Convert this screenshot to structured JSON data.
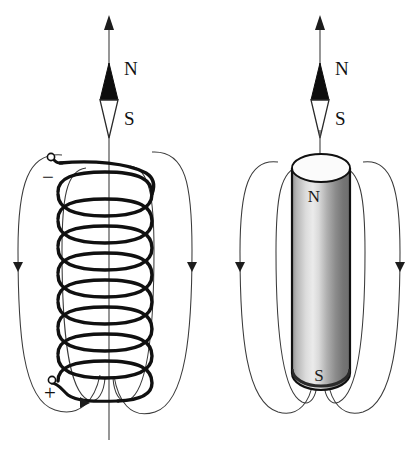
{
  "figure": {
    "background_color": "#ffffff",
    "width": 420,
    "height": 475
  },
  "panels": [
    {
      "id": "solenoid-panel",
      "name": "solenoid",
      "compass": {
        "north_label": "N",
        "south_label": "S",
        "north_color": "#0d0d0d",
        "south_color": "#ffffff"
      },
      "terminals": [
        {
          "name": "negative-terminal",
          "sign": "−",
          "position": "top-left"
        },
        {
          "name": "positive-terminal",
          "sign": "+",
          "position": "bottom-left"
        }
      ],
      "coil": {
        "turns": 8,
        "wire_color": "#101010"
      },
      "field_lines": {
        "count": 4,
        "arrow_direction": "down",
        "color": "#3a3a3a"
      }
    },
    {
      "id": "bar-magnet-panel",
      "name": "bar-magnet",
      "compass": {
        "north_label": "N",
        "south_label": "S",
        "north_color": "#0d0d0d",
        "south_color": "#ffffff"
      },
      "magnet": {
        "north_label": "N",
        "south_label": "S",
        "shape": "cylinder",
        "shading": "gradient-light-left-dark-right"
      },
      "field_lines": {
        "count": 4,
        "arrow_direction": "down",
        "color": "#3a3a3a"
      }
    }
  ]
}
